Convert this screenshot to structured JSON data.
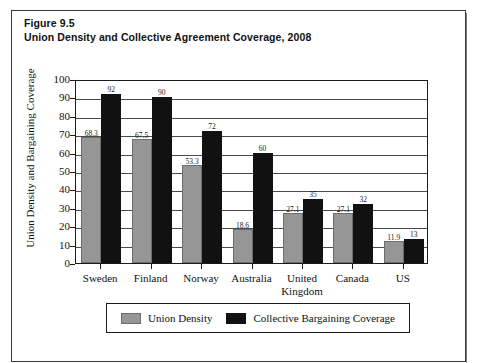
{
  "figure": {
    "number_label": "Figure 9.5",
    "title": "Union Density and Collective Agreement Coverage, 2008"
  },
  "legend": {
    "items": [
      {
        "label": "Union Density",
        "color": "#969696",
        "swatch_name": "legend-swatch-union-density"
      },
      {
        "label": "Collective Bargaining Coverage",
        "color": "#111111",
        "swatch_name": "legend-swatch-collective-bargaining"
      }
    ]
  },
  "chart_data": {
    "type": "bar",
    "title": "Union Density and Collective Agreement Coverage, 2008",
    "xlabel": "",
    "ylabel": "Union Density and Bargaining Coverage",
    "ylim": [
      0,
      100
    ],
    "ytick_labels": [
      "100",
      "90",
      "80",
      "70",
      "60",
      "50",
      "40",
      "30",
      "20",
      "10",
      "0"
    ],
    "ytick_values": [
      100,
      90,
      80,
      70,
      60,
      50,
      40,
      30,
      20,
      10,
      0
    ],
    "grid": true,
    "grid_axis": "y",
    "legend_position": "bottom",
    "categories": [
      "Sweden",
      "Finland",
      "Norway",
      "Australia",
      "United Kingdom",
      "Canada",
      "US"
    ],
    "category_lines": [
      [
        "Sweden"
      ],
      [
        "Finland"
      ],
      [
        "Norway"
      ],
      [
        "Australia"
      ],
      [
        "United",
        "Kingdom"
      ],
      [
        "Canada"
      ],
      [
        "US"
      ]
    ],
    "series": [
      {
        "name": "Union Density",
        "color": "#969696",
        "values": [
          68.3,
          67.5,
          53.3,
          18.6,
          27.1,
          27.1,
          11.9
        ],
        "labels": [
          "68.3",
          "67.5",
          "53.3",
          "18.6",
          "27.1",
          "27.1",
          "11.9"
        ]
      },
      {
        "name": "Collective Bargaining Coverage",
        "color": "#111111",
        "values": [
          92,
          90,
          72,
          60,
          35,
          32,
          13
        ],
        "labels": [
          "92",
          "90",
          "72",
          "60",
          "35",
          "32",
          "13"
        ]
      }
    ]
  }
}
